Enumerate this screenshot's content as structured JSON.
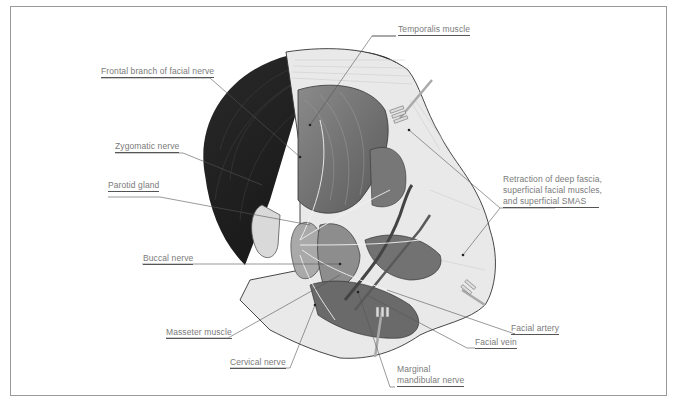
{
  "diagram": {
    "type": "anatomical-illustration",
    "colors": {
      "frame": "#9a9a9a",
      "label_text": "#7a7a7a",
      "leader_line": "#555555",
      "hair": "#1e1e1e",
      "muscle": "#6e6e6e",
      "fascia": "#e6e6e6"
    },
    "labels": {
      "temporalis": "Temporalis muscle",
      "frontal": "Frontal branch of facial nerve",
      "zygomatic": "Zygomatic nerve",
      "parotid": "Parotid gland",
      "retraction_1": "Retraction of deep fascia,",
      "retraction_2": "superficial facial muscles,",
      "retraction_3": "and superficial SMAS",
      "buccal": "Buccal nerve",
      "masseter": "Masseter muscle",
      "cervical": "Cervical nerve",
      "facial_artery": "Facial artery",
      "facial_vein": "Facial vein",
      "marginal_1": "Marginal",
      "marginal_2": "mandibular nerve"
    }
  }
}
